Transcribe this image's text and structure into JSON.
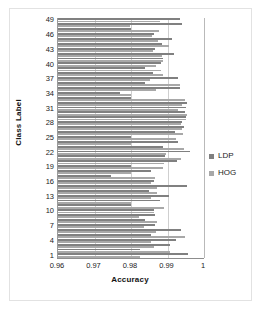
{
  "chart_data": {
    "type": "bar",
    "orientation": "horizontal",
    "title": "",
    "xlabel": "Accuracy",
    "ylabel": "Class Label",
    "xlim": [
      0.96,
      1.0
    ],
    "xticks": [
      "0.96",
      "0.97",
      "0.98",
      "0.99",
      "1"
    ],
    "xtick_values": [
      0.96,
      0.97,
      0.98,
      0.99,
      1.0
    ],
    "yticks": [
      "49",
      "46",
      "43",
      "40",
      "37",
      "34",
      "31",
      "28",
      "25",
      "22",
      "19",
      "16",
      "13",
      "10",
      "7",
      "4",
      "1"
    ],
    "ytick_values": [
      49,
      46,
      43,
      40,
      37,
      34,
      31,
      28,
      25,
      22,
      19,
      16,
      13,
      10,
      7,
      4,
      1
    ],
    "grid": true,
    "legend_position": "right",
    "categories": [
      1,
      2,
      3,
      4,
      5,
      6,
      7,
      8,
      9,
      10,
      11,
      12,
      13,
      14,
      15,
      16,
      17,
      18,
      19,
      20,
      21,
      22,
      23,
      24,
      25,
      26,
      27,
      28,
      29,
      30,
      31,
      32,
      33,
      34,
      35,
      36,
      37,
      38,
      39,
      40,
      41,
      42,
      43,
      44,
      45,
      46,
      47,
      48,
      49
    ],
    "series": [
      {
        "name": "LDP",
        "color": "#808080",
        "values": [
          0.9957,
          0.9824,
          0.9908,
          0.9922,
          0.9856,
          0.9938,
          0.9865,
          0.9838,
          0.9866,
          0.9862,
          0.98,
          0.988,
          0.9905,
          0.9849,
          0.9953,
          0.9863,
          0.9746,
          0.9856,
          0.98,
          0.9925,
          0.9892,
          0.9962,
          0.9889,
          0.993,
          0.98,
          0.992,
          0.9946,
          0.994,
          0.9951,
          0.9948,
          0.9951,
          0.9954,
          0.98,
          0.977,
          0.9935,
          0.9838,
          0.993,
          0.9859,
          0.9838,
          0.9882,
          0.9888,
          0.9918,
          0.9867,
          0.9884,
          0.9912,
          0.9863,
          0.98,
          0.9941,
          0.9934
        ],
        "unit": "accuracy"
      },
      {
        "name": "HOG",
        "color": "#a8a8a8",
        "values": [
          0.9826,
          0.9908,
          0.9862,
          0.9855,
          0.9947,
          0.9868,
          0.9836,
          0.987,
          0.9822,
          0.9864,
          0.989,
          0.98,
          0.9855,
          0.987,
          0.9871,
          0.9855,
          0.9866,
          0.9799,
          0.9889,
          0.989,
          0.9938,
          0.9896,
          0.9945,
          0.9799,
          0.9923,
          0.9942,
          0.9941,
          0.9937,
          0.9952,
          0.9954,
          0.9928,
          0.994,
          0.9949,
          0.98,
          0.9869,
          0.9935,
          0.9852,
          0.9888,
          0.9881,
          0.9869,
          0.9889,
          0.9884,
          0.9861,
          0.9903,
          0.9874,
          0.9858,
          0.9878,
          0.9796,
          0.988
        ],
        "unit": "accuracy"
      }
    ]
  },
  "legend": {
    "items": [
      {
        "label": "LDP",
        "color": "#808080"
      },
      {
        "label": "HOG",
        "color": "#a8a8a8"
      }
    ]
  }
}
